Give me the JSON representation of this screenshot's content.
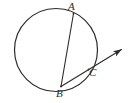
{
  "figure": {
    "kind": "circle-geometry-diagram",
    "background_color": "#ffffff",
    "stroke_color": "#2b2b2b",
    "width": 135,
    "height": 103,
    "circle": {
      "name": "main-circle",
      "cx": 56,
      "cy": 50,
      "r": 41.5,
      "stroke_width": 1.2
    },
    "points": [
      {
        "id": "A",
        "label": "A",
        "x": 73.5,
        "y": 13.5,
        "label_x": 68,
        "label_y": 1
      },
      {
        "id": "B",
        "label": "B",
        "x": 61.0,
        "y": 86.5,
        "label_x": 56,
        "label_y": 88
      },
      {
        "id": "C",
        "label": "C",
        "x": 88.5,
        "y": 69.5,
        "label_x": 89,
        "label_y": 67
      }
    ],
    "segments": [
      {
        "name": "chord-AB",
        "from": "A",
        "to": "B",
        "x1": 73.5,
        "y1": 13.5,
        "x2": 61.0,
        "y2": 86.5,
        "stroke_width": 1.1
      },
      {
        "name": "ray-BC-arrow",
        "from": "B",
        "through": "C",
        "x1": 61.0,
        "y1": 86.5,
        "x2": 124.0,
        "y2": 47.5,
        "stroke_width": 1.1,
        "arrowhead": true,
        "arrow_tip_x": 124.0,
        "arrow_tip_y": 47.5
      }
    ],
    "arcs": [
      {
        "name": "arc-BC",
        "from": "B",
        "to": "C",
        "description": "minor arc of the circle between B and C"
      }
    ]
  }
}
